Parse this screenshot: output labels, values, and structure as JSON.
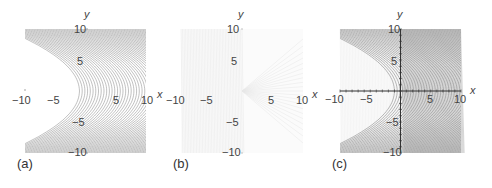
{
  "chart_data": [
    {
      "type": "line",
      "panel_label": "(a)",
      "title": "",
      "xlabel": "x",
      "ylabel": "y",
      "xlim": [
        -10,
        10
      ],
      "ylim": [
        -10,
        10
      ],
      "x_ticks": [
        "-10",
        "-5",
        "5",
        "10"
      ],
      "y_ticks": [
        "10",
        "5",
        "-5",
        "-10"
      ],
      "grid": false,
      "axes_visible": false,
      "description": "Contour lines of parabolic level curves x = c - y^2/k opening to the left; dense dark contours on right, blank region near (-10..0, 0)",
      "line_color": "#8a8a8a"
    },
    {
      "type": "line",
      "panel_label": "(b)",
      "title": "",
      "xlabel": "x",
      "ylabel": "y",
      "xlim": [
        -10,
        10
      ],
      "ylim": [
        -10,
        10
      ],
      "x_ticks": [
        "-10",
        "-5",
        "5",
        "10"
      ],
      "y_ticks": [
        "10",
        "5",
        "-5",
        "-10"
      ],
      "grid": false,
      "axes_visible": false,
      "description": "Very faint contours: dense on the left, faint rays fanning to the right from origin",
      "line_color": "#e2e2e2"
    },
    {
      "type": "line",
      "panel_label": "(c)",
      "title": "",
      "xlabel": "x",
      "ylabel": "y",
      "xlim": [
        -10,
        10
      ],
      "ylim": [
        -10,
        10
      ],
      "x_ticks": [
        "-10",
        "-5",
        "5",
        "10"
      ],
      "y_ticks": [
        "10",
        "5",
        "-5",
        "-10"
      ],
      "grid": false,
      "axes_visible": true,
      "description": "Overlay of (a) and (b) with visible x and y axes; dense contours for x>0, parabolic contours for x<0",
      "line_color": "#7a7a7a"
    }
  ],
  "panels": [
    {
      "label": "(a)",
      "axis_x": "x",
      "axis_y": "y"
    },
    {
      "label": "(b)",
      "axis_x": "x",
      "axis_y": "y"
    },
    {
      "label": "(c)",
      "axis_x": "x",
      "axis_y": "y"
    }
  ],
  "ticks": {
    "xm10": "−10",
    "xm5": "−5",
    "x5": "5",
    "x10": "10",
    "y10": "10",
    "y5": "5",
    "ym5": "−5",
    "ym10": "−10"
  }
}
